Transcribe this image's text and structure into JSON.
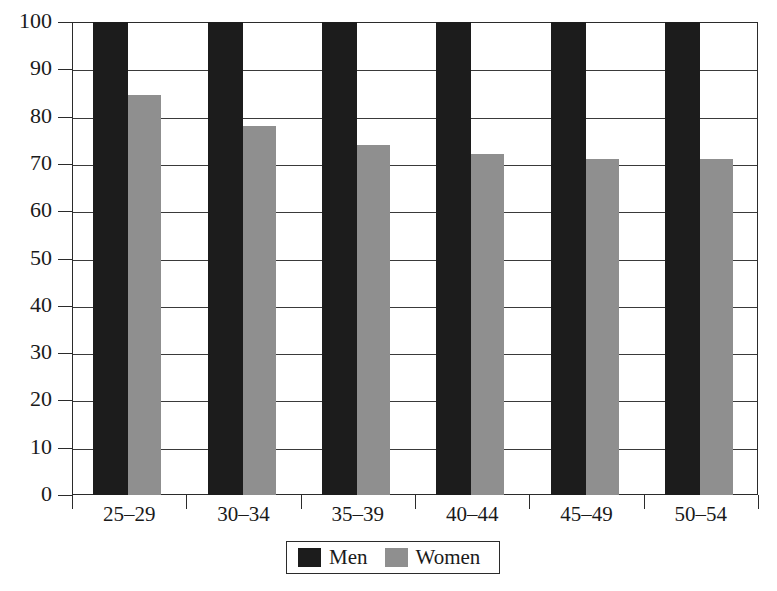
{
  "chart_data": {
    "type": "bar",
    "title": "",
    "subtitle": "",
    "xlabel": "",
    "ylabel": "",
    "categories": [
      "25–29",
      "30–34",
      "35–39",
      "40–44",
      "45–49",
      "50–54"
    ],
    "series": [
      {
        "name": "Men",
        "color": "#1c1c1c",
        "values": [
          100,
          100,
          100,
          100,
          100,
          100
        ]
      },
      {
        "name": "Women",
        "color": "#8f8f8f",
        "values": [
          84.5,
          78,
          74,
          72,
          71,
          71
        ]
      }
    ],
    "ylim": [
      0,
      100
    ],
    "y_ticks": [
      0,
      10,
      20,
      30,
      40,
      50,
      60,
      70,
      80,
      90,
      100
    ],
    "y_tick_labels": [
      "0",
      "10",
      "20",
      "30",
      "40",
      "50",
      "60",
      "70",
      "80",
      "90",
      "100"
    ],
    "grid": true,
    "grid_axis": "y",
    "legend": {
      "position": "bottom-center",
      "entries": [
        {
          "label": "Men",
          "color": "#1c1c1c",
          "swatch": "men-swatch"
        },
        {
          "label": "Women",
          "color": "#8f8f8f",
          "swatch": "women-swatch"
        }
      ]
    }
  },
  "colors": {
    "men": "#1c1c1c",
    "women": "#8f8f8f",
    "axis": "#2b2b2b",
    "grid": "#3a3a3a",
    "background": "#ffffff"
  }
}
